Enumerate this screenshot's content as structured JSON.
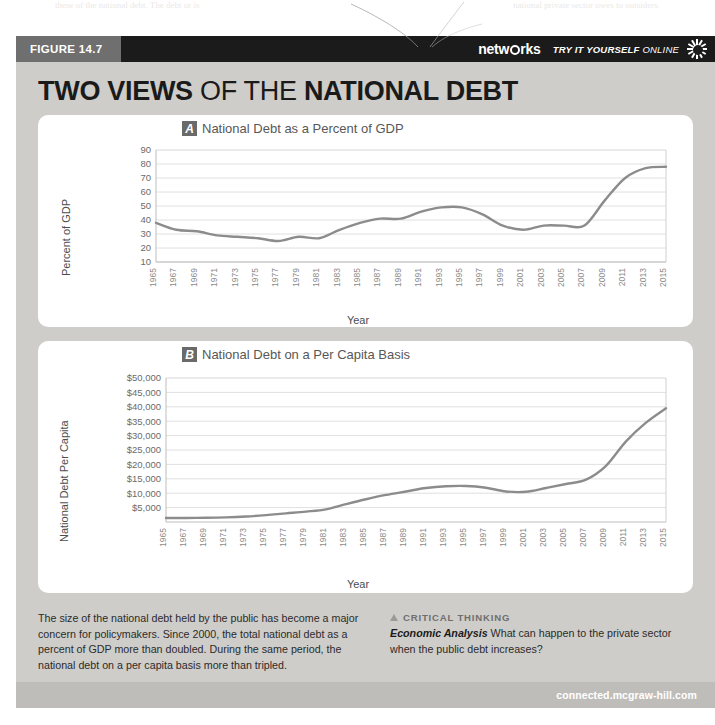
{
  "page_bleed": {
    "left": "these of the national debt. The debt or is",
    "right": "national private sector owes to outsiders."
  },
  "figure": {
    "number_label": "FIGURE 14.7",
    "brand": "netw rks",
    "brand_icon": "globe-o-icon",
    "try_it_label": "TRY IT YOURSELF",
    "online_label": "ONLINE",
    "sun_icon": "sunburst-icon",
    "title_part1": "TWO VIEWS",
    "title_part2": " OF THE ",
    "title_part3": "NATIONAL DEBT",
    "footer_url": "connected.mcgraw-hill.com"
  },
  "caption": {
    "left_text": "The size of the national debt held by the public has become a major concern for policymakers. Since 2000, the total national debt as a percent of GDP more than doubled. During the same period, the national debt on a per capita basis more than tripled.",
    "critical_thinking_heading": "CRITICAL THINKING",
    "critical_thinking_triangle": "triangle-up-icon",
    "prompt_label": "Economic Analysis",
    "prompt_text": "What can happen to the private sector when the public debt increases?"
  },
  "chart_data": [
    {
      "id": "A",
      "type": "line",
      "panel_letter": "A",
      "title": "National Debt as a Percent of GDP",
      "xlabel": "Year",
      "ylabel": "Percent of GDP",
      "ylim": [
        10,
        90
      ],
      "ytick_step": 10,
      "ytick_labels": [
        "90",
        "80",
        "70",
        "60",
        "50",
        "40",
        "30",
        "20",
        "10"
      ],
      "grid": true,
      "legend": "none",
      "line_color": "#8c8c8c",
      "x": [
        1965,
        1967,
        1969,
        1971,
        1973,
        1975,
        1977,
        1979,
        1981,
        1983,
        1985,
        1987,
        1989,
        1991,
        1993,
        1995,
        1997,
        1999,
        2001,
        2003,
        2005,
        2007,
        2009,
        2011,
        2013,
        2015
      ],
      "xtick_labels": [
        "1965",
        "1967",
        "1969",
        "1971",
        "1973",
        "1975",
        "1977",
        "1979",
        "1981",
        "1983",
        "1985",
        "1987",
        "1989",
        "1991",
        "1993",
        "1995",
        "1997",
        "1999",
        "2001",
        "2003",
        "2005",
        "2007",
        "2009",
        "2011",
        "2013",
        "2015"
      ],
      "values": [
        38,
        33,
        32,
        29,
        28,
        27,
        25,
        28,
        27,
        33,
        38,
        41,
        41,
        46,
        49,
        49,
        44,
        36,
        33,
        36,
        36,
        36,
        54,
        70,
        77,
        78
      ]
    },
    {
      "id": "B",
      "type": "line",
      "panel_letter": "B",
      "title": "National Debt on a Per Capita Basis",
      "xlabel": "Year",
      "ylabel": "National Debt Per Capita",
      "ylim": [
        0,
        50000
      ],
      "ytick_step": 5000,
      "ytick_labels": [
        "$50,000",
        "$45,000",
        "$40,000",
        "$35,000",
        "$30,000",
        "$25,000",
        "$20,000",
        "$15,000",
        "$10,000",
        "$5,000"
      ],
      "grid": true,
      "legend": "none",
      "line_color": "#8c8c8c",
      "x": [
        1965,
        1967,
        1969,
        1971,
        1973,
        1975,
        1977,
        1979,
        1981,
        1983,
        1985,
        1987,
        1989,
        1991,
        1993,
        1995,
        1997,
        1999,
        2001,
        2003,
        2005,
        2007,
        2009,
        2011,
        2013,
        2015
      ],
      "xtick_labels": [
        "1965",
        "1967",
        "1969",
        "1971",
        "1973",
        "1975",
        "1977",
        "1979",
        "1981",
        "1983",
        "1985",
        "1987",
        "1989",
        "1991",
        "1993",
        "1995",
        "1997",
        "1999",
        "2001",
        "2003",
        "2005",
        "2007",
        "2009",
        "2011",
        "2013",
        "2015"
      ],
      "values": [
        1400,
        1400,
        1450,
        1600,
        1900,
        2400,
        3000,
        3600,
        4400,
        6200,
        7900,
        9400,
        10600,
        11800,
        12400,
        12500,
        11900,
        10600,
        10500,
        11800,
        13200,
        14700,
        19500,
        28000,
        34500,
        39500
      ]
    }
  ]
}
